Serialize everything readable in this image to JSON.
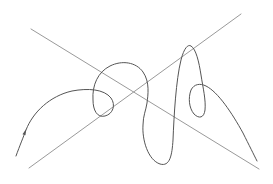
{
  "figure": {
    "width": 273,
    "height": 184,
    "background": "#ffffff"
  },
  "straight_lines": [
    {
      "name": "descending-line",
      "x1": 31,
      "y1": 29,
      "x2": 259,
      "y2": 169,
      "color": "#9a9a9a",
      "width": 1
    },
    {
      "name": "ascending-line",
      "x1": 29,
      "y1": 168,
      "x2": 241,
      "y2": 14,
      "color": "#9a9a9a",
      "width": 1
    }
  ],
  "curve": {
    "name": "looping-curve",
    "color": "#555555",
    "width": 1,
    "path": "M16,156 C20,145 23,138 26,130 C33,112 50,96 72,91 C88,88 104,89 111,98 C116,105 113,114 105,116 C97,118 93,110 93,100 C92,85 98,72 110,66 C122,60 136,62 143,72 C150,82 148,95 147,103 C146,110 143,116 143,125 C142,140 148,160 160,164 C170,167 172,155 173,140 C174,115 176,80 181,60 C184,48 188,44 191,46 C196,49 199,62 201,75 C203,88 206,100 205,110 C204,118 199,119 194,114 C189,108 188,98 191,90 C194,84 200,83 206,86 C218,92 232,113 243,133 C249,145 254,155 257,161",
    "arrow_marker": {
      "x": 25,
      "y": 132,
      "angle": -70
    }
  }
}
